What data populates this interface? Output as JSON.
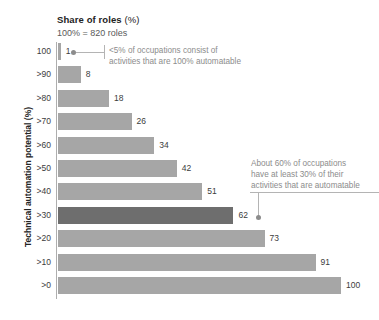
{
  "chart_data": {
    "type": "bar",
    "orientation": "horizontal",
    "title": "Share of roles (%)",
    "title_unit": "(%)",
    "title_main": "Share of roles",
    "subtitle": "100% = 820 roles",
    "xlabel": "Share of roles (%)",
    "ylabel": "Technical automation potential (%)",
    "xlim": [
      0,
      100
    ],
    "grid": false,
    "legend": "none",
    "categories": [
      "100",
      ">90",
      ">80",
      ">70",
      ">60",
      ">50",
      ">40",
      ">30",
      ">20",
      ">10",
      ">0"
    ],
    "values": [
      1,
      8,
      18,
      26,
      34,
      42,
      51,
      62,
      73,
      91,
      100
    ],
    "highlight_category": ">30",
    "highlight_value": 62,
    "colors": {
      "bar": "#a6a6a6",
      "bar_highlight": "#6e6e6e",
      "text": "#3c3c3c",
      "annotation": "#8c8c8c",
      "axis": "#aeaeae",
      "background": "#ffffff"
    },
    "annotations": [
      {
        "id": "annotation-top",
        "target_category": "100",
        "target_value": 1,
        "lines": [
          "<5% of occupations consist of",
          "activities that are 100% automatable"
        ]
      },
      {
        "id": "annotation-mid",
        "target_category": ">30",
        "target_value": 62,
        "lines": [
          "About 60% of occupations",
          "have at least 30% of their",
          "activities that are automatable"
        ]
      }
    ]
  }
}
